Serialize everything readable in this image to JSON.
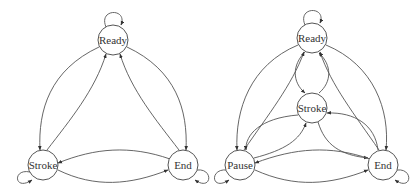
{
  "diagrams": [
    {
      "name": "three-state-machine",
      "nodes": [
        {
          "id": "ready",
          "label": "Ready",
          "x": 113,
          "y": 40
        },
        {
          "id": "stroke",
          "label": "Stroke",
          "x": 43,
          "y": 165
        },
        {
          "id": "end",
          "label": "End",
          "x": 183,
          "y": 165
        }
      ],
      "edges": [
        [
          "ready",
          "ready"
        ],
        [
          "stroke",
          "stroke"
        ],
        [
          "end",
          "end"
        ],
        [
          "ready",
          "stroke"
        ],
        [
          "stroke",
          "ready"
        ],
        [
          "ready",
          "end"
        ],
        [
          "end",
          "ready"
        ],
        [
          "stroke",
          "end"
        ],
        [
          "end",
          "stroke"
        ]
      ]
    },
    {
      "name": "four-state-machine",
      "nodes": [
        {
          "id": "ready",
          "label": "Ready",
          "x": 312,
          "y": 38
        },
        {
          "id": "stroke",
          "label": "Stroke",
          "x": 312,
          "y": 108
        },
        {
          "id": "pause",
          "label": "Pause",
          "x": 240,
          "y": 165
        },
        {
          "id": "end",
          "label": "End",
          "x": 383,
          "y": 165
        }
      ],
      "edges": [
        [
          "ready",
          "ready"
        ],
        [
          "pause",
          "pause"
        ],
        [
          "end",
          "end"
        ],
        [
          "ready",
          "stroke"
        ],
        [
          "stroke",
          "ready"
        ],
        [
          "ready",
          "pause"
        ],
        [
          "pause",
          "ready"
        ],
        [
          "ready",
          "end"
        ],
        [
          "end",
          "ready"
        ],
        [
          "stroke",
          "pause"
        ],
        [
          "pause",
          "stroke"
        ],
        [
          "stroke",
          "end"
        ],
        [
          "end",
          "stroke"
        ],
        [
          "pause",
          "end"
        ],
        [
          "end",
          "pause"
        ]
      ]
    }
  ]
}
